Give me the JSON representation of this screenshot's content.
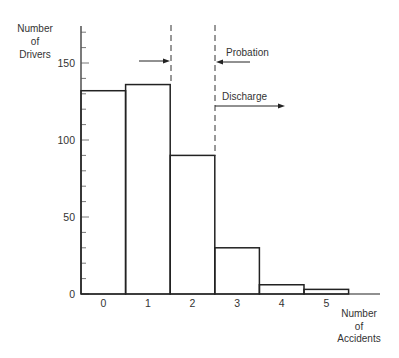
{
  "chart_data": {
    "type": "bar",
    "title": "",
    "xlabel": "Number of Accidents",
    "ylabel": "Number of Drivers",
    "xlabel_lines": [
      "Number",
      "of",
      "Accidents"
    ],
    "ylabel_lines": [
      "Number",
      "of",
      "Drivers"
    ],
    "categories": [
      "0",
      "1",
      "2",
      "3",
      "4",
      "5"
    ],
    "values": [
      132,
      136,
      90,
      30,
      6,
      3
    ],
    "ylim": [
      0,
      174
    ],
    "yticks_major": [
      0,
      50,
      100,
      150
    ],
    "ytick_labels": [
      "0",
      "50",
      "100",
      "150"
    ],
    "yticks_minor_step": 10,
    "grid": false,
    "legend": null,
    "annotations": [
      {
        "type": "dashed-threshold",
        "x_between": [
          "1",
          "2"
        ],
        "label": ""
      },
      {
        "type": "dashed-threshold",
        "x_between": [
          "2",
          "3"
        ],
        "label": ""
      },
      {
        "text": "Probation",
        "arrow": "left",
        "target": "threshold between 2 and 3"
      },
      {
        "text": "Discharge",
        "arrow": "right",
        "target": "region beyond 2"
      },
      {
        "text": "",
        "arrow": "right",
        "target": "threshold between 1 and 2"
      }
    ]
  },
  "labels": {
    "probation": "Probation",
    "discharge": "Discharge"
  },
  "colors": {
    "line": "#222222",
    "text": "#333333",
    "background": "#ffffff"
  }
}
